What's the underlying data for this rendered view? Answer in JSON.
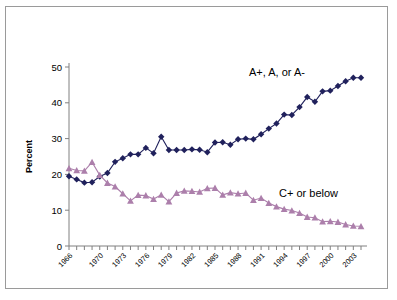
{
  "figure": {
    "background": "#ffffff",
    "border_color": "#9a9a9a"
  },
  "annotations": {
    "series_a_label": "A+, A, or A-",
    "series_c_label": "C+ or below"
  },
  "chart_data": {
    "type": "line",
    "title": "",
    "xlabel": "",
    "ylabel": "Percent",
    "ylim": [
      0,
      50
    ],
    "yticks": [
      0,
      10,
      20,
      30,
      40,
      50
    ],
    "ytick_labels": [
      "0",
      "10",
      "20",
      "30",
      "40",
      "50"
    ],
    "xlim": [
      1966,
      2004
    ],
    "xtick_labels": [
      "1966",
      "1970",
      "1973",
      "1976",
      "1979",
      "1982",
      "1985",
      "1988",
      "1991",
      "1994",
      "1997",
      "2000",
      "2003"
    ],
    "xtick_years": [
      1966,
      1970,
      1973,
      1976,
      1979,
      1982,
      1985,
      1988,
      1991,
      1994,
      1997,
      2000,
      2003
    ],
    "grid": false,
    "legend_position": "inline-annotation",
    "x": [
      1966,
      1967,
      1968,
      1969,
      1970,
      1971,
      1972,
      1973,
      1974,
      1975,
      1976,
      1977,
      1978,
      1979,
      1980,
      1981,
      1982,
      1983,
      1984,
      1985,
      1986,
      1987,
      1988,
      1989,
      1990,
      1991,
      1992,
      1993,
      1994,
      1995,
      1996,
      1997,
      1998,
      1999,
      2000,
      2001,
      2002,
      2003,
      2004
    ],
    "series": [
      {
        "name": "A+, A, or A-",
        "color": "#20215c",
        "marker": "diamond",
        "values": [
          19.5,
          18.6,
          17.7,
          17.8,
          19.4,
          20.4,
          23.5,
          24.5,
          25.6,
          25.6,
          27.4,
          25.9,
          30.5,
          26.8,
          26.8,
          26.8,
          27.0,
          26.9,
          26.2,
          28.9,
          29.0,
          28.3,
          29.8,
          30.0,
          29.8,
          31.2,
          32.8,
          34.2,
          36.7,
          36.6,
          38.8,
          41.6,
          40.3,
          43.2,
          43.4,
          44.7,
          46.0,
          47.0,
          47.0
        ]
      },
      {
        "name": "C+ or below",
        "color": "#ac7fab",
        "marker": "triangle",
        "values": [
          21.7,
          21.1,
          21.0,
          23.4,
          19.8,
          17.6,
          16.6,
          14.6,
          12.6,
          14.2,
          14.1,
          13.1,
          14.3,
          12.4,
          14.8,
          15.4,
          15.3,
          15.1,
          16.1,
          16.2,
          14.3,
          14.9,
          14.6,
          14.8,
          12.8,
          13.4,
          12.0,
          11.0,
          10.3,
          9.9,
          9.2,
          8.1,
          7.9,
          6.8,
          6.9,
          6.7,
          6.0,
          5.6,
          5.5
        ]
      }
    ]
  }
}
